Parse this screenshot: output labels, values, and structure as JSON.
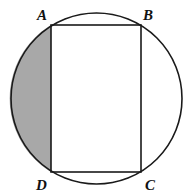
{
  "diagram": {
    "labels": {
      "a": "A",
      "b": "B",
      "c": "C",
      "d": "D"
    },
    "colors": {
      "stroke": "#1a1a1a",
      "shade": "#a8a8a8",
      "background": "#ffffff"
    }
  }
}
